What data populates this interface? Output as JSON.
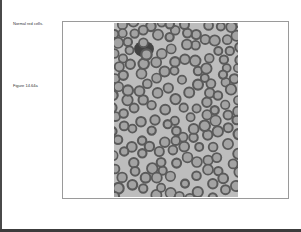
{
  "slide": {
    "caption": "Normal red cells.",
    "figure_label": "Figure 14.64a"
  },
  "image": {
    "subject": "blood-smear-micrograph",
    "description": "Grayscale micrograph of normal red blood cells",
    "colors": {
      "background": "#bdbdbd",
      "cell_ring": "#5a5a5a",
      "cell_center": "#a3a3a3",
      "dark_cluster": "#2e2e2e"
    }
  },
  "frame": {
    "border_color": "#9a9a9a"
  }
}
